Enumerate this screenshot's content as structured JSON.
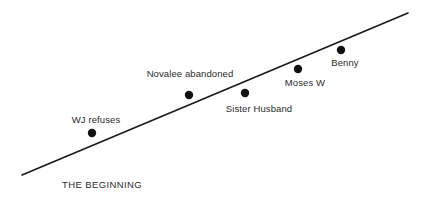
{
  "diagram": {
    "type": "rising-action-plot-line",
    "background_color": "#ffffff",
    "line_color": "#1a1a1a",
    "dot_color": "#111111",
    "text_color": "#2b2b2b",
    "arc": {
      "start": {
        "x": 22,
        "y": 175
      },
      "end": {
        "x": 408,
        "y": 13
      },
      "stroke_width": 1.6
    },
    "stage_labels": [
      {
        "id": "beginning",
        "text": "THE BEGINNING",
        "x": 62,
        "y": 179
      }
    ],
    "events": [
      {
        "id": "wj-refuses",
        "label": "WJ refuses",
        "dot": {
          "x": 92,
          "y": 133,
          "r": 4.2
        },
        "label_x": 96,
        "label_y": 114
      },
      {
        "id": "novalee-abandoned",
        "label": "Novalee abandoned",
        "dot": {
          "x": 189,
          "y": 95,
          "r": 4.2
        },
        "label_x": 190,
        "label_y": 68
      },
      {
        "id": "sister-husband",
        "label": "Sister Husband",
        "dot": {
          "x": 245,
          "y": 93,
          "r": 4.2
        },
        "label_x": 259,
        "label_y": 103
      },
      {
        "id": "moses-w",
        "label": "Moses W",
        "dot": {
          "x": 298,
          "y": 69,
          "r": 4.2
        },
        "label_x": 305,
        "label_y": 77
      },
      {
        "id": "benny",
        "label": "Benny",
        "dot": {
          "x": 341,
          "y": 50,
          "r": 4.2
        },
        "label_x": 345,
        "label_y": 57
      }
    ]
  }
}
